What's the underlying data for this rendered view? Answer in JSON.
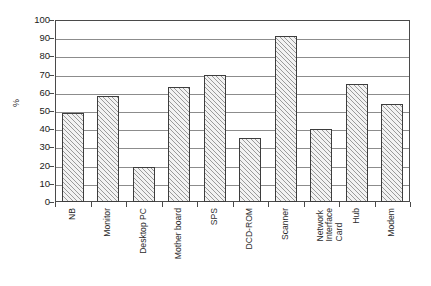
{
  "chart_data": {
    "type": "bar",
    "title": "",
    "subtitle": "",
    "xlabel": "",
    "ylabel": "%",
    "ylim": [
      0,
      100
    ],
    "ytick_step": 10,
    "yticks": [
      100,
      90,
      80,
      70,
      60,
      50,
      40,
      30,
      20,
      10,
      0
    ],
    "grid": true,
    "grid_axis": "y",
    "legend": false,
    "legend_position": "none",
    "categories": [
      "NB",
      "Monitor",
      "Desktop PC",
      "Mother board",
      "SPS",
      "DCD-ROM",
      "Scanner",
      "Network\nInterface\nCard",
      "Hub",
      "Modem"
    ],
    "values": [
      49,
      58,
      19,
      63,
      70,
      35,
      91,
      40,
      65,
      54
    ],
    "bar_fill": "hatched-diagonal",
    "bar_edge_color": "#3d3d3d",
    "bar_fill_color": "#f2f2f2",
    "hatch_color": "#9a9a9a",
    "grid_color": "#8c8c8c",
    "axis_color": "#4a4a4a",
    "background_color": "#ffffff"
  }
}
